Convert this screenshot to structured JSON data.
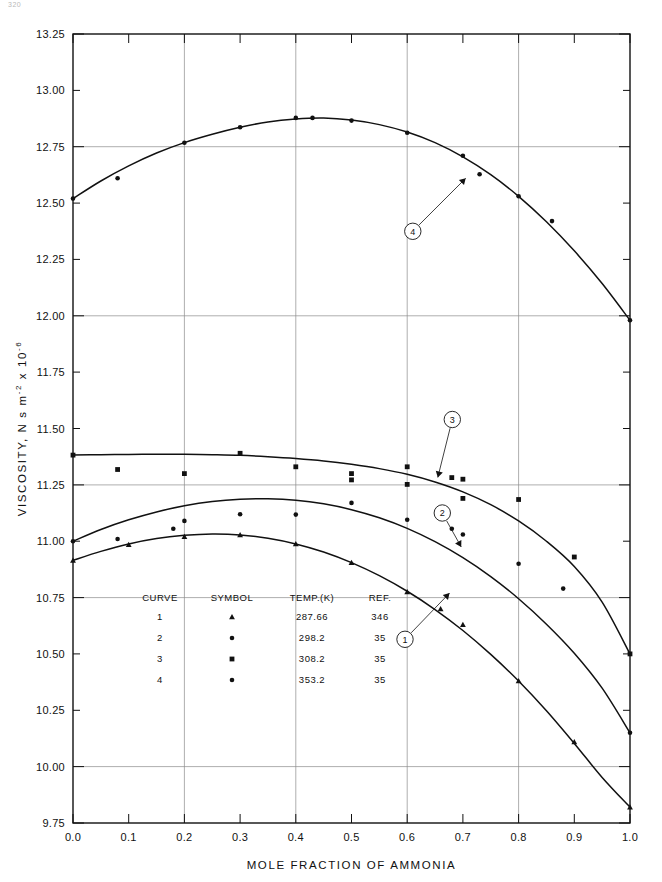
{
  "page": {
    "number": "320"
  },
  "chart_data": {
    "type": "line",
    "title": "",
    "xlabel": "MOLE FRACTION OF AMMONIA",
    "ylabel": "VISCOSITY,  N s m⁻²x 10⁻⁶",
    "ylabel_parts": {
      "main": "VISCOSITY,  N s m",
      "sup1": "-2",
      "mid": " x 10",
      "sup2": "-6"
    },
    "xlim": [
      0.0,
      1.0
    ],
    "ylim": [
      9.75,
      13.25
    ],
    "xticks": [
      "0.0",
      "0.1",
      "0.2",
      "0.3",
      "0.4",
      "0.5",
      "0.6",
      "0.7",
      "0.8",
      "0.9",
      "1.0"
    ],
    "xtick_values": [
      0.0,
      0.1,
      0.2,
      0.3,
      0.4,
      0.5,
      0.6,
      0.7,
      0.8,
      0.9,
      1.0
    ],
    "yticks": [
      "9.75",
      "10.00",
      "10.25",
      "10.50",
      "10.75",
      "11.00",
      "11.25",
      "11.50",
      "11.75",
      "12.00",
      "12.25",
      "12.50",
      "12.75",
      "13.00",
      "13.25"
    ],
    "ytick_values": [
      9.75,
      10.0,
      10.25,
      10.5,
      10.75,
      11.0,
      11.25,
      11.5,
      11.75,
      12.0,
      12.25,
      12.5,
      12.75,
      13.0,
      13.25
    ],
    "grid": {
      "x_major": [
        0.2,
        0.4,
        0.6,
        0.8
      ],
      "y_major": [
        10.0,
        10.75,
        11.25,
        12.0,
        12.75
      ],
      "on": true
    },
    "legend": {
      "position": "inside-lower-left",
      "headers": [
        "CURVE",
        "SYMBOL",
        "TEMP.(K)",
        "REF."
      ],
      "rows": [
        {
          "curve": "1",
          "symbol": "triangle",
          "temp": "287.66",
          "ref": "346"
        },
        {
          "curve": "2",
          "symbol": "dot",
          "temp": "298.2",
          "ref": "35"
        },
        {
          "curve": "3",
          "symbol": "square",
          "temp": "308.2",
          "ref": "35"
        },
        {
          "curve": "4",
          "symbol": "dot",
          "temp": "353.2",
          "ref": "35"
        }
      ]
    },
    "callouts": [
      {
        "label": "1",
        "cx": 0.596,
        "cy": 10.565,
        "tipx": 0.676,
        "tipy": 10.77
      },
      {
        "label": "2",
        "cx": 0.663,
        "cy": 11.125,
        "tipx": 0.697,
        "tipy": 10.975
      },
      {
        "label": "3",
        "cx": 0.681,
        "cy": 11.54,
        "tipx": 0.655,
        "tipy": 11.283
      },
      {
        "label": "4",
        "cx": 0.61,
        "cy": 12.375,
        "tipx": 0.705,
        "tipy": 12.61
      }
    ],
    "series": [
      {
        "name": "1",
        "label": "287.66 K",
        "symbol": "triangle",
        "curve_x": [
          0.0,
          0.05,
          0.1,
          0.15,
          0.2,
          0.25,
          0.3,
          0.35,
          0.4,
          0.45,
          0.5,
          0.55,
          0.6,
          0.65,
          0.7,
          0.75,
          0.8,
          0.85,
          0.9,
          0.95,
          1.0
        ],
        "curve_y": [
          10.915,
          10.955,
          10.988,
          11.012,
          11.026,
          11.032,
          11.028,
          11.013,
          10.988,
          10.952,
          10.905,
          10.847,
          10.778,
          10.697,
          10.604,
          10.498,
          10.38,
          10.248,
          10.103,
          9.952,
          9.82
        ],
        "points": [
          {
            "x": 0.0,
            "y": 10.915
          },
          {
            "x": 0.1,
            "y": 10.985
          },
          {
            "x": 0.2,
            "y": 11.02
          },
          {
            "x": 0.3,
            "y": 11.028
          },
          {
            "x": 0.4,
            "y": 10.988
          },
          {
            "x": 0.5,
            "y": 10.905
          },
          {
            "x": 0.6,
            "y": 10.775
          },
          {
            "x": 0.66,
            "y": 10.7
          },
          {
            "x": 0.7,
            "y": 10.63
          },
          {
            "x": 0.8,
            "y": 10.38
          },
          {
            "x": 0.9,
            "y": 10.11
          },
          {
            "x": 1.0,
            "y": 9.82
          }
        ]
      },
      {
        "name": "2",
        "label": "298.2 K",
        "symbol": "dot",
        "curve_x": [
          0.0,
          0.05,
          0.1,
          0.15,
          0.2,
          0.25,
          0.3,
          0.35,
          0.4,
          0.45,
          0.5,
          0.55,
          0.6,
          0.65,
          0.7,
          0.75,
          0.8,
          0.85,
          0.9,
          0.95,
          1.0
        ],
        "curve_y": [
          11.0,
          11.052,
          11.095,
          11.13,
          11.157,
          11.176,
          11.186,
          11.188,
          11.182,
          11.166,
          11.14,
          11.104,
          11.057,
          10.998,
          10.927,
          10.843,
          10.745,
          10.632,
          10.503,
          10.348,
          10.15
        ],
        "points": [
          {
            "x": 0.0,
            "y": 11.0
          },
          {
            "x": 0.08,
            "y": 11.01
          },
          {
            "x": 0.18,
            "y": 11.055
          },
          {
            "x": 0.2,
            "y": 11.09
          },
          {
            "x": 0.3,
            "y": 11.12
          },
          {
            "x": 0.4,
            "y": 11.118
          },
          {
            "x": 0.5,
            "y": 11.17
          },
          {
            "x": 0.6,
            "y": 11.095
          },
          {
            "x": 0.68,
            "y": 11.055
          },
          {
            "x": 0.7,
            "y": 11.03
          },
          {
            "x": 0.8,
            "y": 10.9
          },
          {
            "x": 0.88,
            "y": 10.79
          },
          {
            "x": 1.0,
            "y": 10.15
          }
        ]
      },
      {
        "name": "3",
        "label": "308.2 K",
        "symbol": "square",
        "curve_x": [
          0.0,
          0.05,
          0.1,
          0.15,
          0.2,
          0.25,
          0.3,
          0.35,
          0.4,
          0.45,
          0.5,
          0.55,
          0.6,
          0.65,
          0.7,
          0.75,
          0.8,
          0.85,
          0.9,
          0.95,
          1.0
        ],
        "curve_y": [
          11.382,
          11.384,
          11.385,
          11.386,
          11.386,
          11.384,
          11.381,
          11.375,
          11.367,
          11.356,
          11.341,
          11.322,
          11.297,
          11.263,
          11.219,
          11.162,
          11.09,
          11.0,
          10.888,
          10.73,
          10.5
        ],
        "points": [
          {
            "x": 0.0,
            "y": 11.382
          },
          {
            "x": 0.08,
            "y": 11.318
          },
          {
            "x": 0.2,
            "y": 11.3
          },
          {
            "x": 0.3,
            "y": 11.39
          },
          {
            "x": 0.4,
            "y": 11.33
          },
          {
            "x": 0.5,
            "y": 11.3
          },
          {
            "x": 0.5,
            "y": 11.272
          },
          {
            "x": 0.6,
            "y": 11.33
          },
          {
            "x": 0.6,
            "y": 11.252
          },
          {
            "x": 0.68,
            "y": 11.282
          },
          {
            "x": 0.7,
            "y": 11.275
          },
          {
            "x": 0.7,
            "y": 11.19
          },
          {
            "x": 0.8,
            "y": 11.185
          },
          {
            "x": 0.9,
            "y": 10.93
          },
          {
            "x": 1.0,
            "y": 10.5
          }
        ]
      },
      {
        "name": "4",
        "label": "353.2 K",
        "symbol": "dot",
        "curve_x": [
          0.0,
          0.05,
          0.1,
          0.15,
          0.2,
          0.25,
          0.3,
          0.35,
          0.4,
          0.45,
          0.5,
          0.55,
          0.6,
          0.65,
          0.7,
          0.75,
          0.8,
          0.85,
          0.9,
          0.95,
          1.0
        ],
        "curve_y": [
          12.52,
          12.598,
          12.665,
          12.722,
          12.768,
          12.805,
          12.836,
          12.86,
          12.873,
          12.877,
          12.868,
          12.848,
          12.815,
          12.768,
          12.705,
          12.626,
          12.53,
          12.417,
          12.288,
          12.143,
          11.98
        ],
        "points": [
          {
            "x": 0.0,
            "y": 12.52
          },
          {
            "x": 0.08,
            "y": 12.61
          },
          {
            "x": 0.2,
            "y": 12.768
          },
          {
            "x": 0.3,
            "y": 12.836
          },
          {
            "x": 0.4,
            "y": 12.878
          },
          {
            "x": 0.43,
            "y": 12.878
          },
          {
            "x": 0.5,
            "y": 12.866
          },
          {
            "x": 0.6,
            "y": 12.812
          },
          {
            "x": 0.7,
            "y": 12.71
          },
          {
            "x": 0.73,
            "y": 12.628
          },
          {
            "x": 0.8,
            "y": 12.53
          },
          {
            "x": 0.86,
            "y": 12.42
          },
          {
            "x": 1.0,
            "y": 11.98
          }
        ]
      }
    ]
  }
}
